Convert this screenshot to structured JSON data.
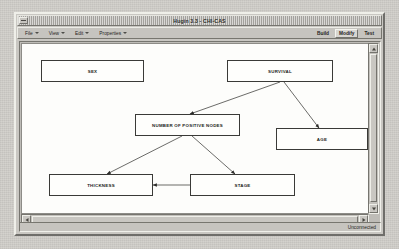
{
  "window": {
    "title": "Hugin 3.3 - CHI-CAS",
    "system_menu_icon": "window-menu-icon"
  },
  "menubar": {
    "items": [
      {
        "label": "File",
        "caret": true
      },
      {
        "label": "View",
        "caret": true
      },
      {
        "label": "Edit",
        "caret": true
      },
      {
        "label": "Properties",
        "caret": true
      }
    ],
    "modes": [
      {
        "label": "Build",
        "active": false
      },
      {
        "label": "Modify",
        "active": true
      },
      {
        "label": "Test",
        "active": false
      }
    ]
  },
  "canvas": {
    "nodes": [
      {
        "id": "sex",
        "label": "SEX",
        "x": 19,
        "y": 16,
        "w": 103,
        "h": 22
      },
      {
        "id": "survival",
        "label": "SURVIVAL",
        "x": 205,
        "y": 16,
        "w": 106,
        "h": 22
      },
      {
        "id": "nodes",
        "label": "NUMBER OF POSITIVE NODES",
        "x": 113,
        "y": 70,
        "w": 105,
        "h": 22
      },
      {
        "id": "age",
        "label": "AGE",
        "x": 254,
        "y": 84,
        "w": 92,
        "h": 22
      },
      {
        "id": "thickness",
        "label": "THICKNESS",
        "x": 27,
        "y": 130,
        "w": 104,
        "h": 22
      },
      {
        "id": "stage",
        "label": "STAGE",
        "x": 168,
        "y": 130,
        "w": 105,
        "h": 22
      }
    ],
    "edges": [
      {
        "from": "survival",
        "to": "nodes",
        "x1": 258,
        "y1": 38,
        "x2": 168,
        "y2": 70
      },
      {
        "from": "survival",
        "to": "age",
        "x1": 262,
        "y1": 38,
        "x2": 297,
        "y2": 84
      },
      {
        "from": "nodes",
        "to": "thickness",
        "x1": 160,
        "y1": 92,
        "x2": 85,
        "y2": 130
      },
      {
        "from": "nodes",
        "to": "stage",
        "x1": 170,
        "y1": 92,
        "x2": 213,
        "y2": 130
      },
      {
        "from": "stage",
        "to": "thickness",
        "x1": 168,
        "y1": 141,
        "x2": 131,
        "y2": 141
      }
    ]
  },
  "scrollbars": {
    "vertical": {
      "up_icon": "arrow-up-icon",
      "down_icon": "arrow-down-icon"
    },
    "horizontal": {
      "left_icon": "arrow-left-icon",
      "right_icon": "arrow-right-icon"
    }
  },
  "statusbar": {
    "text": "Unconnected"
  }
}
